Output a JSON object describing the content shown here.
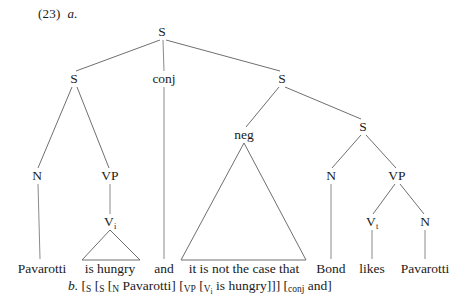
{
  "example": {
    "number": "(23)",
    "item_a_label": "a.",
    "item_b_label": "b."
  },
  "tree": {
    "nodes": [
      {
        "id": "root-s",
        "label": "S",
        "x": 162,
        "y": 32
      },
      {
        "id": "left-s",
        "label": "S",
        "x": 74,
        "y": 79
      },
      {
        "id": "conj",
        "label": "conj",
        "x": 164,
        "y": 79
      },
      {
        "id": "right-s",
        "label": "S",
        "x": 282,
        "y": 79
      },
      {
        "id": "left-n",
        "label": "N",
        "x": 37,
        "y": 176
      },
      {
        "id": "left-vp",
        "label": "VP",
        "x": 110,
        "y": 176
      },
      {
        "id": "left-vi",
        "label": "V",
        "sub": "i",
        "x": 110,
        "y": 222
      },
      {
        "id": "neg",
        "label": "neg",
        "x": 244,
        "y": 135
      },
      {
        "id": "inner-s",
        "label": "S",
        "x": 363,
        "y": 127
      },
      {
        "id": "inner-n",
        "label": "N",
        "x": 331,
        "y": 176
      },
      {
        "id": "inner-vp",
        "label": "VP",
        "x": 397,
        "y": 176
      },
      {
        "id": "inner-vt",
        "label": "V",
        "sub": "t",
        "x": 372,
        "y": 222
      },
      {
        "id": "inner-n2",
        "label": "N",
        "x": 425,
        "y": 222
      }
    ],
    "terminals": [
      {
        "id": "term-pavarotti-1",
        "text": "Pavarotti",
        "x": 42
      },
      {
        "id": "term-is-hungry",
        "text": "is hungry",
        "x": 110
      },
      {
        "id": "term-and",
        "text": "and",
        "x": 164
      },
      {
        "id": "term-neg-phrase",
        "text": "it is not the case that",
        "x": 244
      },
      {
        "id": "term-bond",
        "text": "Bond",
        "x": 331
      },
      {
        "id": "term-likes",
        "text": "likes",
        "x": 372
      },
      {
        "id": "term-pavarotti-2",
        "text": "Pavarotti",
        "x": 425
      }
    ]
  },
  "bracket_notation": {
    "parts": [
      {
        "type": "italic",
        "text": "b."
      },
      {
        "type": "plain",
        "text": "["
      },
      {
        "type": "smallcap",
        "text": "S"
      },
      {
        "type": "plain",
        "text": " ["
      },
      {
        "type": "smallcap",
        "text": "S"
      },
      {
        "type": "plain",
        "text": " ["
      },
      {
        "type": "smallcap",
        "text": "N"
      },
      {
        "type": "plain",
        "text": " Pavarotti] ["
      },
      {
        "type": "smallcap",
        "text": "VP"
      },
      {
        "type": "plain",
        "text": " ["
      },
      {
        "type": "smallcap-sub",
        "text": "V",
        "sub": "i"
      },
      {
        "type": "plain",
        "text": " is hungry]]] ["
      },
      {
        "type": "smallcap",
        "text": "conj"
      },
      {
        "type": "plain",
        "text": " and]"
      }
    ],
    "full_text": "b. [S [S [N Pavarotti] [VP [Vi is hungry]]] [conj and]"
  },
  "colors": {
    "line": "#6f6f6f",
    "stem": "#8a8a8a",
    "text": "#1a1a1a",
    "background": "#ffffff"
  }
}
